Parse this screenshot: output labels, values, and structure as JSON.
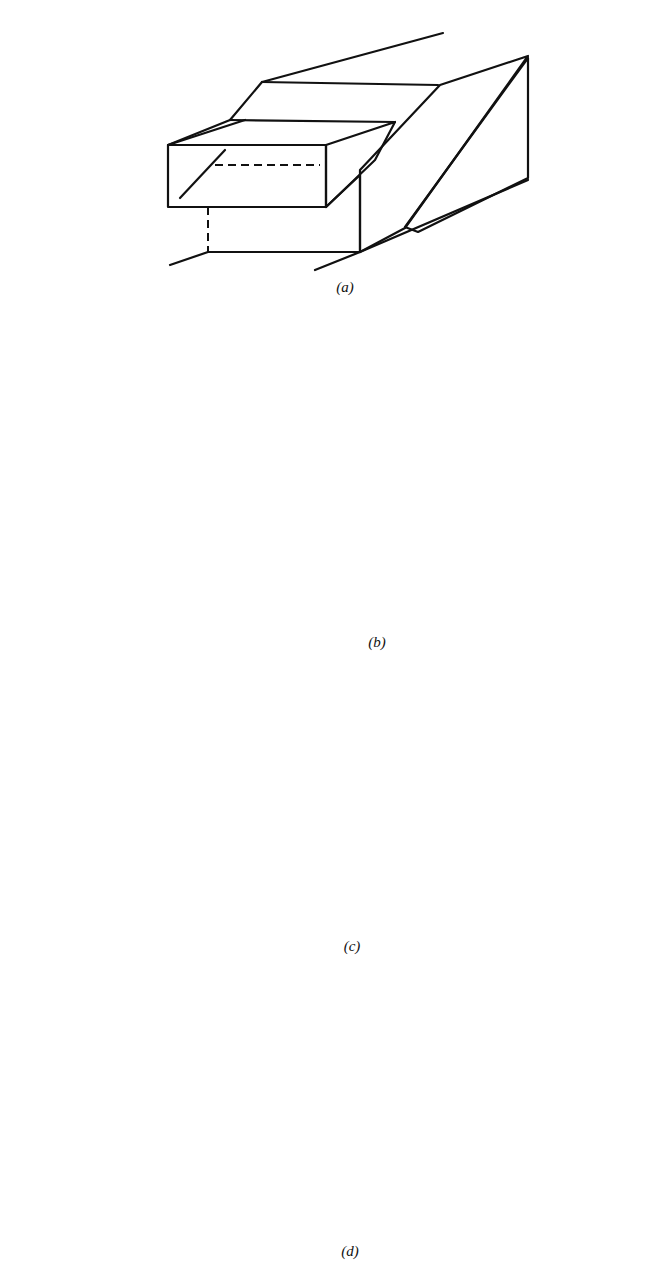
{
  "figure": {
    "panels": [
      {
        "id": "a",
        "caption": "(a)",
        "subject": "plane-failure-block-diagram"
      },
      {
        "id": "b",
        "caption": "(b)",
        "subject": "wedge-failure-block-diagram"
      },
      {
        "id": "c",
        "caption": "(c)",
        "subject": "toppling-failure-block-diagram"
      },
      {
        "id": "d",
        "caption": "(d)",
        "subject": "circular-slide-block-diagram"
      }
    ],
    "colors": {
      "ink": "#111111",
      "paper": "#ffffff"
    }
  }
}
